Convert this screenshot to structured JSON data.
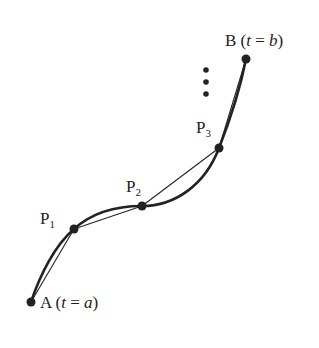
{
  "diagram": {
    "points": {
      "A": {
        "name": "A",
        "param": "t",
        "eq": "=",
        "value": "a"
      },
      "P1": {
        "name": "P",
        "sub": "1"
      },
      "P2": {
        "name": "P",
        "sub": "2"
      },
      "P3": {
        "name": "P",
        "sub": "3"
      },
      "B": {
        "name": "B",
        "param": "t",
        "eq": "=",
        "value": "b"
      }
    },
    "ellipsis": "⋮",
    "colors": {
      "curve": "#222222",
      "point": "#222222",
      "background": "#ffffff"
    }
  }
}
